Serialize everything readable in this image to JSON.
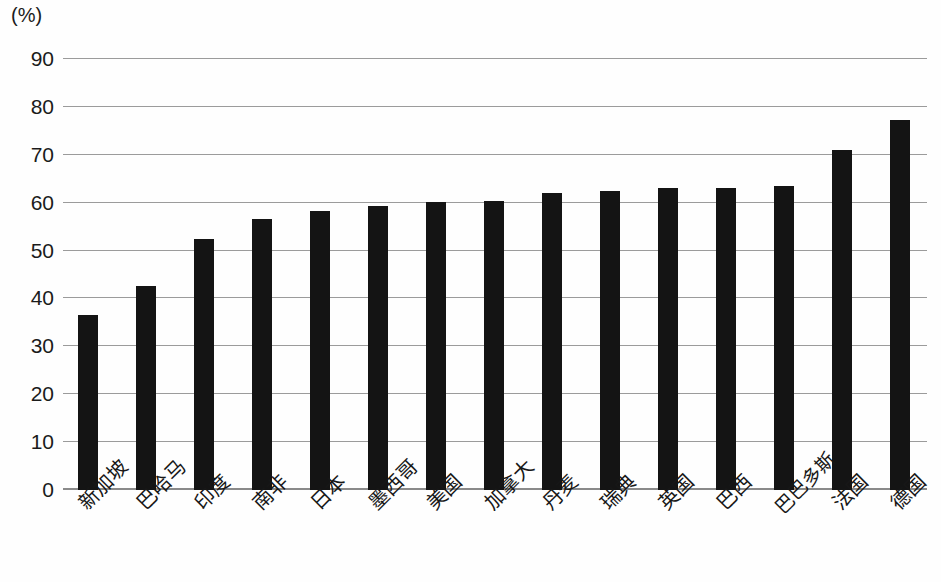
{
  "chart_data": {
    "type": "bar",
    "title": "",
    "subtitle": "",
    "xlabel": "",
    "ylabel": "(%)",
    "unit_label": "(%)",
    "ylim": [
      0,
      90
    ],
    "ytick_step": 10,
    "yticks": [
      90,
      80,
      70,
      60,
      50,
      40,
      30,
      20,
      10,
      0
    ],
    "ytick_labels": [
      "90",
      "80",
      "70",
      "60",
      "50",
      "40",
      "30",
      "20",
      "10",
      "0"
    ],
    "grid": true,
    "legend": false,
    "legend_position": "none",
    "bar_color": "#141414",
    "gridline_color": "#9b9b9b",
    "background_color": "#fefefe",
    "categories": [
      "新加坡",
      "巴哈马",
      "印度",
      "南非",
      "日本",
      "墨西哥",
      "美国",
      "加拿大",
      "丹麦",
      "瑞典",
      "英国",
      "巴西",
      "巴巴多斯",
      "法国",
      "德国"
    ],
    "values": [
      36.6,
      42.7,
      52.4,
      56.6,
      58.2,
      59.3,
      60.2,
      60.3,
      62.0,
      62.4,
      63.0,
      63.0,
      63.4,
      71.0,
      77.2
    ],
    "series": [
      {
        "name": "",
        "values": [
          36.6,
          42.7,
          52.4,
          56.6,
          58.2,
          59.3,
          60.2,
          60.3,
          62.0,
          62.4,
          63.0,
          63.0,
          63.4,
          71.0,
          77.2
        ]
      }
    ]
  }
}
